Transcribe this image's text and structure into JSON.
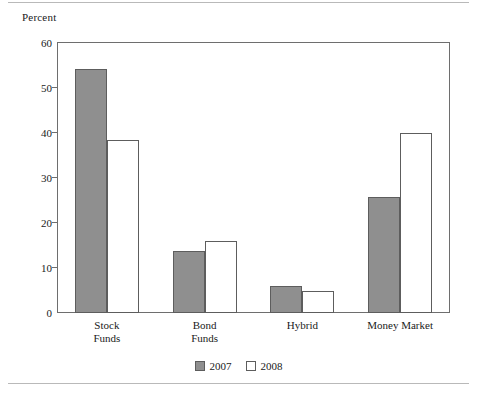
{
  "figure": {
    "ylabel": "Percent",
    "legend_position": "bottom-center"
  },
  "chart_data": {
    "type": "bar",
    "title": "",
    "xlabel": "",
    "ylabel": "Percent",
    "ylim": [
      0,
      60
    ],
    "yticks": [
      0,
      10,
      20,
      30,
      40,
      50,
      60
    ],
    "grid": false,
    "legend": [
      "2007",
      "2008"
    ],
    "categories": [
      "Stock\nFunds",
      "Bond\nFunds",
      "Hybrid",
      "Money Market"
    ],
    "series": [
      {
        "name": "2007",
        "color": "#8f8f8f",
        "values": [
          54.2,
          13.7,
          6.0,
          25.7
        ]
      },
      {
        "name": "2008",
        "color": "#ffffff",
        "values": [
          38.4,
          16.0,
          5.0,
          39.9
        ]
      }
    ]
  }
}
